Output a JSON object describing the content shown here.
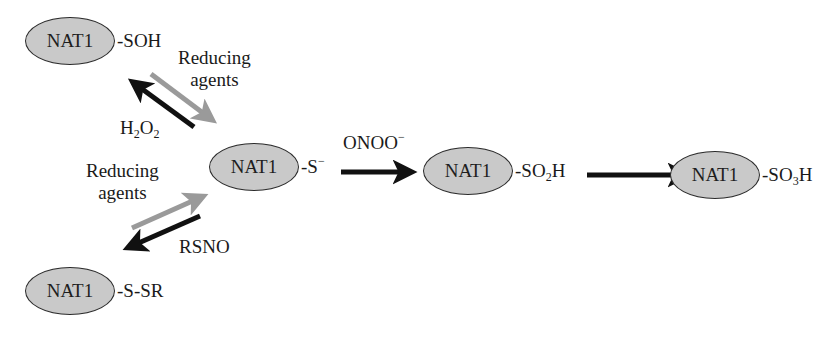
{
  "diagram": {
    "type": "reaction-scheme",
    "nodes": {
      "soh": {
        "protein": "NAT1",
        "group": "-SOH"
      },
      "thiolate": {
        "protein": "NAT1",
        "group_main": "-S",
        "group_sup": "−"
      },
      "so2h": {
        "protein": "NAT1",
        "group_pre": "-SO",
        "group_sub": "2",
        "group_post": "H"
      },
      "so3h": {
        "protein": "NAT1",
        "group_pre": "-SO",
        "group_sub": "3",
        "group_post": "H"
      },
      "ssr": {
        "protein": "NAT1",
        "group": "-S-SR"
      }
    },
    "labels": {
      "reducing_agents_top": {
        "line1": "Reducing",
        "line2": "agents"
      },
      "h2o2": {
        "pre": "H",
        "sub1": "2",
        "mid": "O",
        "sub2": "2"
      },
      "reducing_agents_bottom": {
        "line1": "Reducing",
        "line2": "agents"
      },
      "rsno": "RSNO",
      "onoo": {
        "main": "ONOO",
        "sup": "−"
      }
    },
    "edges": [
      {
        "from": "thiolate",
        "to": "soh",
        "label": "H2O2",
        "color": "#111111"
      },
      {
        "from": "soh",
        "to": "thiolate",
        "label": "Reducing agents",
        "color": "#9a9a9a"
      },
      {
        "from": "thiolate",
        "to": "ssr",
        "label": "RSNO",
        "color": "#111111"
      },
      {
        "from": "ssr",
        "to": "thiolate",
        "label": "Reducing agents",
        "color": "#9a9a9a"
      },
      {
        "from": "thiolate",
        "to": "so2h",
        "label": "ONOO−",
        "color": "#111111"
      },
      {
        "from": "so2h",
        "to": "so3h",
        "label": "",
        "color": "#111111"
      }
    ],
    "colors": {
      "ellipse_fill": "#c9c9c9",
      "ellipse_stroke": "#2b2b2b",
      "dark_arrow": "#111111",
      "gray_arrow": "#9a9a9a"
    }
  }
}
